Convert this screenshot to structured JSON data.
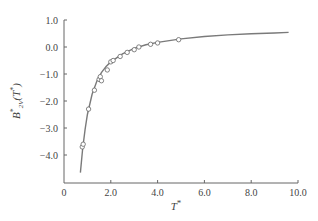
{
  "chart_data": {
    "type": "line",
    "title": "",
    "xlabel": "T*",
    "ylabel": "B*2V(T*)",
    "xlim": [
      0,
      10.0
    ],
    "ylim": [
      -5.0,
      1.0
    ],
    "grid": false,
    "legend": null,
    "x_ticks": [
      "0",
      "2.0",
      "4.0",
      "6.0",
      "8.0",
      "10.0"
    ],
    "x_tick_values": [
      0,
      2,
      4,
      6,
      8,
      10
    ],
    "y_ticks": [
      "1.0",
      "0.0",
      "-1.0",
      "-2.0",
      "-3.0",
      "-4.0"
    ],
    "y_tick_values": [
      1,
      0,
      -1,
      -2,
      -3,
      -4
    ],
    "series": [
      {
        "name": "theory curve",
        "style": "line",
        "color": "#888888",
        "x": [
          0.7,
          0.8,
          0.9,
          1.0,
          1.2,
          1.4,
          1.6,
          1.8,
          2.0,
          2.5,
          3.0,
          3.5,
          4.0,
          5.0,
          6.0,
          7.0,
          8.0,
          9.0,
          9.6
        ],
        "y": [
          -4.65,
          -3.75,
          -3.05,
          -2.5,
          -1.75,
          -1.27,
          -0.95,
          -0.72,
          -0.55,
          -0.25,
          -0.05,
          0.08,
          0.17,
          0.3,
          0.39,
          0.45,
          0.49,
          0.52,
          0.54
        ]
      },
      {
        "name": "experimental data",
        "style": "markers",
        "marker": "open-circle",
        "color": "#666666",
        "x": [
          0.78,
          0.82,
          1.05,
          1.3,
          1.5,
          1.55,
          1.6,
          1.85,
          2.0,
          2.1,
          2.4,
          2.7,
          3.0,
          3.2,
          3.7,
          4.0,
          4.9
        ],
        "y": [
          -3.7,
          -3.6,
          -2.3,
          -1.6,
          -1.2,
          -1.1,
          -1.25,
          -0.85,
          -0.55,
          -0.5,
          -0.35,
          -0.2,
          -0.1,
          0.0,
          0.1,
          0.15,
          0.27
        ]
      }
    ]
  }
}
